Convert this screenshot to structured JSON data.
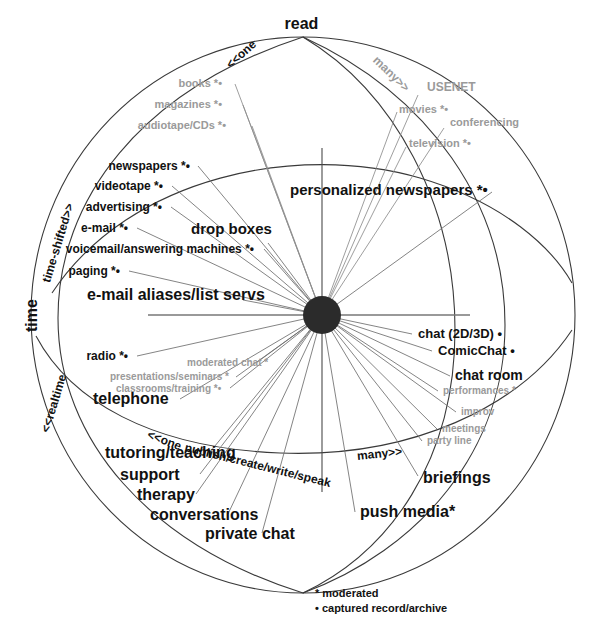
{
  "figure": {
    "poles": {
      "top": "read",
      "bottom_axis": "publish/create/write/speak"
    },
    "axis_labels": {
      "left_main": "time",
      "left_upper": "time-shifted>>",
      "left_lower": "<<realtime",
      "top_left_arc": "<<one",
      "top_right_arc": "many>>",
      "bottom_left_arc": "<<one",
      "bottom_right_arc": "many>>",
      "bottom_arc": "publish/create/write/speak"
    },
    "legend": [
      "* moderated",
      "• captured record/archive"
    ],
    "center_node": "hub"
  },
  "labels": [
    {
      "text": "read",
      "x": 300,
      "y": 26,
      "size": 16,
      "weight": "bold",
      "tone": "black",
      "align": "center"
    },
    {
      "text": "books *•",
      "x": 222,
      "y": 85,
      "size": 11,
      "weight": "bold",
      "tone": "gray",
      "align": "right"
    },
    {
      "text": "magazines *•",
      "x": 222,
      "y": 106,
      "size": 11,
      "weight": "bold",
      "tone": "gray",
      "align": "right"
    },
    {
      "text": "audiotape/CDs *•",
      "x": 226,
      "y": 127,
      "size": 11,
      "weight": "bold",
      "tone": "gray",
      "align": "right"
    },
    {
      "text": "USENET",
      "x": 427,
      "y": 88,
      "size": 12,
      "weight": "bold",
      "tone": "gray",
      "align": "left"
    },
    {
      "text": "movies *•",
      "x": 399,
      "y": 111,
      "size": 11,
      "weight": "bold",
      "tone": "gray",
      "align": "left"
    },
    {
      "text": "conferencing",
      "x": 450,
      "y": 124,
      "size": 11,
      "weight": "bold",
      "tone": "gray",
      "align": "left"
    },
    {
      "text": "television *•",
      "x": 409,
      "y": 145,
      "size": 11,
      "weight": "bold",
      "tone": "gray",
      "align": "left"
    },
    {
      "text": "newspapers *•",
      "x": 190,
      "y": 167,
      "size": 12,
      "weight": "bold",
      "tone": "black",
      "align": "right"
    },
    {
      "text": "videotape *•",
      "x": 163,
      "y": 187,
      "size": 12,
      "weight": "bold",
      "tone": "black",
      "align": "right"
    },
    {
      "text": "personalized newspapers *•",
      "x": 290,
      "y": 191,
      "size": 15,
      "weight": "bold",
      "tone": "black",
      "align": "left"
    },
    {
      "text": "advertising *•",
      "x": 162,
      "y": 208,
      "size": 12,
      "weight": "bold",
      "tone": "black",
      "align": "right"
    },
    {
      "text": "e-mail *•",
      "x": 128,
      "y": 229,
      "size": 12,
      "weight": "bold",
      "tone": "black",
      "align": "right"
    },
    {
      "text": "drop boxes",
      "x": 191,
      "y": 230,
      "size": 15,
      "weight": "bold",
      "tone": "black",
      "align": "left"
    },
    {
      "text": "voicemail/answering machines *•",
      "x": 254,
      "y": 250,
      "size": 12,
      "weight": "bold",
      "tone": "black",
      "align": "right"
    },
    {
      "text": "paging *•",
      "x": 120,
      "y": 272,
      "size": 12,
      "weight": "bold",
      "tone": "black",
      "align": "right"
    },
    {
      "text": "e-mail aliases/list servs",
      "x": 87,
      "y": 297,
      "size": 16,
      "weight": "bold",
      "tone": "black",
      "align": "left"
    },
    {
      "text": "chat (2D/3D) •",
      "x": 418,
      "y": 335,
      "size": 13,
      "weight": "bold",
      "tone": "black",
      "align": "left"
    },
    {
      "text": "ComicChat •",
      "x": 438,
      "y": 352,
      "size": 13,
      "weight": "bold",
      "tone": "black",
      "align": "left"
    },
    {
      "text": "radio *•",
      "x": 128,
      "y": 357,
      "size": 12,
      "weight": "bold",
      "tone": "black",
      "align": "right"
    },
    {
      "text": "moderated chat *",
      "x": 187,
      "y": 364,
      "size": 10,
      "weight": "bold",
      "tone": "gray",
      "align": "left"
    },
    {
      "text": "presentations/seminars *",
      "x": 110,
      "y": 378,
      "size": 10,
      "weight": "bold",
      "tone": "gray",
      "align": "left"
    },
    {
      "text": "chat room",
      "x": 455,
      "y": 377,
      "size": 14,
      "weight": "bold",
      "tone": "black",
      "align": "left"
    },
    {
      "text": "classrooms/training *•",
      "x": 116,
      "y": 390,
      "size": 10,
      "weight": "bold",
      "tone": "gray",
      "align": "left"
    },
    {
      "text": "performances *",
      "x": 443,
      "y": 392,
      "size": 10,
      "weight": "bold",
      "tone": "gray",
      "align": "left"
    },
    {
      "text": "telephone",
      "x": 93,
      "y": 401,
      "size": 16,
      "weight": "bold",
      "tone": "black",
      "align": "left"
    },
    {
      "text": "improv",
      "x": 461,
      "y": 413,
      "size": 10,
      "weight": "bold",
      "tone": "gray",
      "align": "left"
    },
    {
      "text": "meetings",
      "x": 442,
      "y": 430,
      "size": 10,
      "weight": "bold",
      "tone": "gray",
      "align": "left"
    },
    {
      "text": "party line",
      "x": 427,
      "y": 442,
      "size": 10,
      "weight": "bold",
      "tone": "gray",
      "align": "left"
    },
    {
      "text": "tutoring/teaching",
      "x": 105,
      "y": 455,
      "size": 16,
      "weight": "bold",
      "tone": "black",
      "align": "left"
    },
    {
      "text": "support",
      "x": 120,
      "y": 477,
      "size": 16,
      "weight": "bold",
      "tone": "black",
      "align": "left"
    },
    {
      "text": "briefings",
      "x": 423,
      "y": 480,
      "size": 16,
      "weight": "bold",
      "tone": "black",
      "align": "left"
    },
    {
      "text": "therapy",
      "x": 137,
      "y": 497,
      "size": 16,
      "weight": "bold",
      "tone": "black",
      "align": "left"
    },
    {
      "text": "conversations",
      "x": 150,
      "y": 517,
      "size": 16,
      "weight": "bold",
      "tone": "black",
      "align": "left"
    },
    {
      "text": "push media*",
      "x": 360,
      "y": 514,
      "size": 16,
      "weight": "bold",
      "tone": "black",
      "align": "left"
    },
    {
      "text": "private chat",
      "x": 205,
      "y": 536,
      "size": 16,
      "weight": "bold",
      "tone": "black",
      "align": "left"
    }
  ],
  "rotated_labels": [
    {
      "text": "<<one",
      "x": 228,
      "y": 60,
      "rot": -42,
      "size": 12,
      "tone": "black"
    },
    {
      "text": "many>>",
      "x": 375,
      "y": 52,
      "rot": 44,
      "size": 12,
      "tone": "gray"
    },
    {
      "text": "time-shifted>>",
      "x": 46,
      "y": 276,
      "rot": -73,
      "size": 12,
      "tone": "black"
    },
    {
      "text": "time",
      "x": 32,
      "y": 324,
      "rot": -90,
      "size": 16,
      "tone": "black"
    },
    {
      "text": "<<realtime",
      "x": 45,
      "y": 426,
      "rot": -73,
      "size": 12,
      "tone": "black"
    },
    {
      "text": "<<one",
      "x": 148,
      "y": 428,
      "rot": 21,
      "size": 12,
      "tone": "black"
    },
    {
      "text": "publish/create/write/speak",
      "x": 185,
      "y": 441,
      "rot": 14,
      "size": 12,
      "tone": "black"
    },
    {
      "text": "many>>",
      "x": 357,
      "y": 450,
      "rot": -6,
      "size": 12,
      "tone": "black"
    }
  ],
  "legend_lines": [
    "* moderated",
    "• captured record/archive"
  ]
}
